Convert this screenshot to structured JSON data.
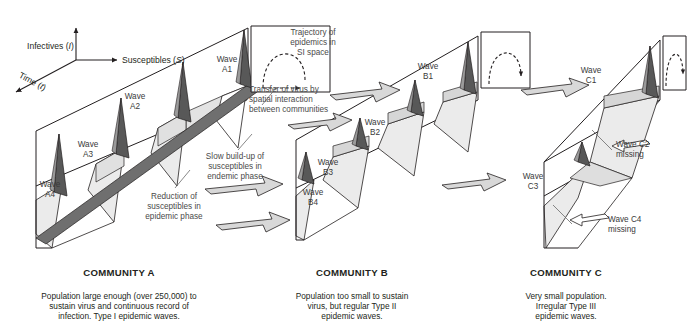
{
  "figure": {
    "background": "#ffffff"
  },
  "axes": {
    "y_label": "Infectives (I)",
    "y_symbol": "I",
    "y_text": "Infectives (",
    "x_label": "Susceptibles (S)",
    "x_symbol": "S",
    "x_text": "Susceptibles (",
    "z_label": "Time (t)",
    "z_symbol": "t",
    "z_text": "Time ("
  },
  "colors": {
    "line": "#231f20",
    "surface_light": "#ebebeb",
    "surface_mid": "#d0d0d0",
    "ridge_dark": "#6f6f6f",
    "peak_dark": "#585858",
    "arrow_fill": "#d8d8d8",
    "text": "#231f20",
    "anno_text": "#4a4a4a"
  },
  "communities": [
    {
      "id": "A",
      "caption_title": "COMMUNITY A",
      "caption_body": "Population large enough (over 250,000) to\nsustain virus and continuous record of\ninfection. Type I epidemic waves.",
      "waves": [
        {
          "label": "Wave\nA1",
          "name": "Wave A1"
        },
        {
          "label": "Wave\nA2",
          "name": "Wave A2"
        },
        {
          "label": "Wave\nA3",
          "name": "Wave A3"
        },
        {
          "label": "Wave\nA4",
          "name": "Wave A4"
        }
      ],
      "missing_waves": []
    },
    {
      "id": "B",
      "caption_title": "COMMUNITY B",
      "caption_body": "Population too small to sustain\nvirus, but regular Type II\nepidemic waves.",
      "waves": [
        {
          "label": "Wave\nB1",
          "name": "Wave B1"
        },
        {
          "label": "Wave\nB2",
          "name": "Wave B2"
        },
        {
          "label": "Wave\nB3",
          "name": "Wave B3"
        },
        {
          "label": "Wave\nB4",
          "name": "Wave B4"
        }
      ],
      "missing_waves": []
    },
    {
      "id": "C",
      "caption_title": "COMMUNITY C",
      "caption_body": "Very small population.\nIrregular Type III\nepidemic waves.",
      "waves": [
        {
          "label": "Wave\nC1",
          "name": "Wave C1"
        },
        {
          "label": "Wave\nC3",
          "name": "Wave C3"
        }
      ],
      "missing_waves": [
        {
          "label": "Wave C2\nmissing",
          "name": "Wave C2 missing"
        },
        {
          "label": "Wave C4\nmissing",
          "name": "Wave C4 missing"
        }
      ]
    }
  ],
  "annotations": {
    "trajectory": "Trajectory of\nepidemics in\nSI space",
    "transfer": "Transfer of virus by\nspatial interaction\nbetween communities",
    "slow_buildup": "Slow build-up of\nsusceptibles in\nendemic phase",
    "reduction": "Reduction of\nsusceptibles in\nepidemic phase"
  }
}
